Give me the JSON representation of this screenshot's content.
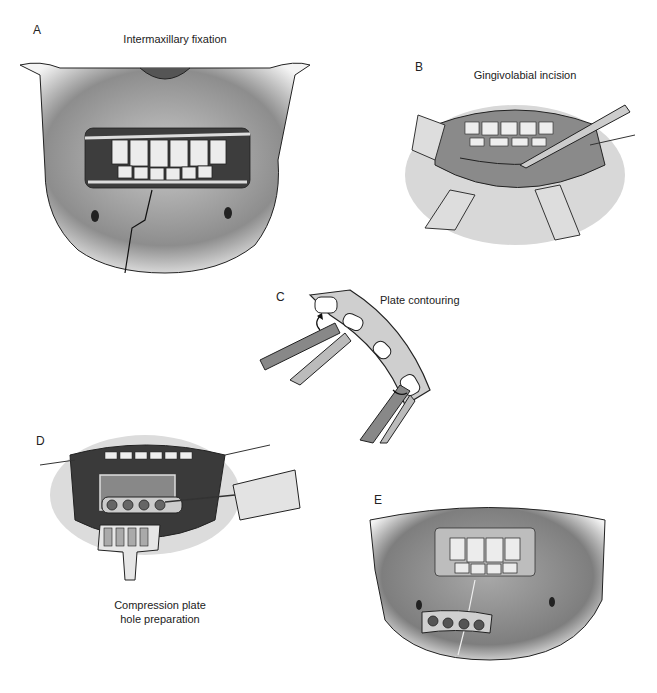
{
  "figure": {
    "header": "",
    "panels": [
      {
        "letter": "A",
        "caption": "Intermaxillary fixation"
      },
      {
        "letter": "B",
        "caption": "Gingivolabial incision"
      },
      {
        "letter": "C",
        "caption": "Plate contouring"
      },
      {
        "letter": "D",
        "caption_line1": "Compression plate",
        "caption_line2": "hole preparation"
      },
      {
        "letter": "E",
        "caption": ""
      }
    ]
  },
  "colors": {
    "background": "#ffffff",
    "ink": "#1a1a1a",
    "bone_shade": "#8a8a8a",
    "bone_light": "#d9d9d9",
    "tooth": "#eeeeee",
    "mouth_dark": "#3a3a3a"
  }
}
